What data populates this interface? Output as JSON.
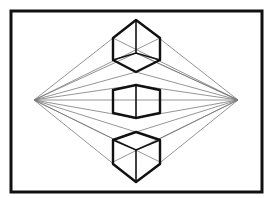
{
  "diagram": {
    "title": "",
    "type": "two-point perspective drawing",
    "frame": {
      "x": 11,
      "y": 11,
      "width": 251,
      "height": 181,
      "color": "#111111"
    },
    "horizon_y": 100,
    "vanishing_points": [
      {
        "name": "left",
        "x": 34,
        "y": 100
      },
      {
        "name": "right",
        "x": 238,
        "y": 100
      }
    ],
    "guide_color": "#7a7a7a",
    "cubes": [
      {
        "name": "above-horizon",
        "view": "from below",
        "vertical_edge_x": 136
      },
      {
        "name": "on-horizon",
        "view": "eye level",
        "vertical_edge_x": 136
      },
      {
        "name": "below-horizon",
        "view": "from above",
        "vertical_edge_x": 136
      }
    ]
  }
}
